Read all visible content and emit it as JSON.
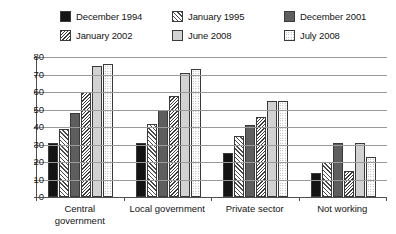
{
  "chart_data": {
    "type": "bar",
    "title": "",
    "xlabel": "",
    "ylabel": "",
    "ylim": [
      0,
      80
    ],
    "ytick_step": 10,
    "yticks": [
      80,
      70,
      60,
      50,
      40,
      30,
      20,
      10,
      0
    ],
    "grid": true,
    "legend_position": "top",
    "categories": [
      "Central\ngovernment",
      "Local government",
      "Private sector",
      "Not working"
    ],
    "category_labels": [
      {
        "line1": "Central",
        "line2": "government"
      },
      {
        "line1": "Local government",
        "line2": ""
      },
      {
        "line1": "Private sector",
        "line2": ""
      },
      {
        "line1": "Not working",
        "line2": ""
      }
    ],
    "series": [
      {
        "name": "December 1994",
        "pattern": "solid-black",
        "values": [
          31,
          31,
          25,
          14
        ]
      },
      {
        "name": "January 1995",
        "pattern": "hatch-light",
        "values": [
          39,
          42,
          35,
          20
        ]
      },
      {
        "name": "December 2001",
        "pattern": "solid-dark",
        "values": [
          48,
          50,
          41,
          31
        ]
      },
      {
        "name": "January 2002",
        "pattern": "hatch-dense",
        "values": [
          60,
          58,
          46,
          15
        ]
      },
      {
        "name": "June 2008",
        "pattern": "solid-light",
        "values": [
          75,
          71,
          55,
          31
        ]
      },
      {
        "name": "July 2008",
        "pattern": "dotted",
        "values": [
          76,
          73,
          55,
          23
        ]
      }
    ]
  },
  "legend": {
    "items": [
      {
        "label": "December 1994",
        "pattern": "solid-black"
      },
      {
        "label": "January 1995",
        "pattern": "hatch-light"
      },
      {
        "label": "December 2001",
        "pattern": "solid-dark"
      },
      {
        "label": "January 2002",
        "pattern": "hatch-dense"
      },
      {
        "label": "June 2008",
        "pattern": "solid-light"
      },
      {
        "label": "July 2008",
        "pattern": "dotted"
      }
    ]
  },
  "colors": {
    "axis": "#4f4f4f",
    "gridline": "#9a9a9a",
    "text": "#141414",
    "background": "#ffffff"
  }
}
